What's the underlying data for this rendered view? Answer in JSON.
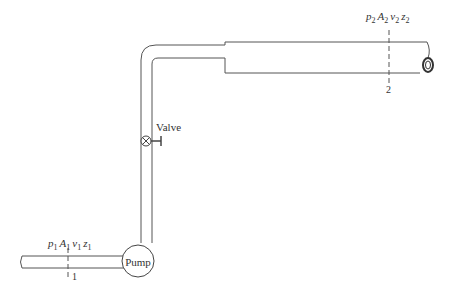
{
  "diagram": {
    "section1": {
      "label_number": "1",
      "p": "p",
      "A": "A",
      "v": "v",
      "z": "z",
      "sub": "1"
    },
    "section2": {
      "label_number": "2",
      "p": "p",
      "A": "A",
      "v": "v",
      "z": "z",
      "sub": "2"
    },
    "pump_label": "Pump",
    "valve_label": "Valve",
    "colors": {
      "line": "#444444",
      "background": "#ffffff"
    }
  }
}
